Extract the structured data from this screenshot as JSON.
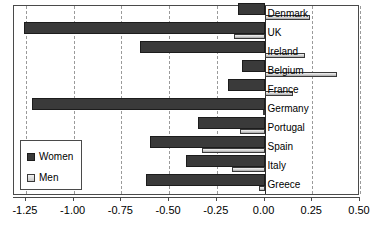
{
  "chart_data": {
    "type": "bar",
    "orientation": "horizontal",
    "title": "",
    "subtitle": "",
    "xlabel": "",
    "ylabel": "",
    "xlim": [
      -1.3125,
      0.5
    ],
    "grid": true,
    "grid_axis": "x",
    "legend_position": "lower-left",
    "categories": [
      "Denmark",
      "UK",
      "Ireland",
      "Belgium",
      "France",
      "Germany",
      "Portugal",
      "Spain",
      "Italy",
      "Greece"
    ],
    "series": [
      {
        "name": "Women",
        "color": "#3a3a3a",
        "values": [
          -0.14,
          -1.26,
          -0.65,
          -0.12,
          -0.19,
          -1.22,
          -0.35,
          -0.6,
          -0.41,
          -0.62
        ]
      },
      {
        "name": "Men",
        "color": "#d0d0d0",
        "values": [
          0.24,
          -0.16,
          0.21,
          0.38,
          0.15,
          -0.01,
          -0.13,
          -0.33,
          -0.17,
          -0.03
        ]
      }
    ],
    "xticks": [
      -1.25,
      -1.0,
      -0.75,
      -0.5,
      -0.25,
      0.0,
      0.25,
      0.5
    ],
    "xticklabels": [
      "-1.25",
      "-1.00",
      "-0.75",
      "-0.50",
      "-0.25",
      "0.00",
      "0.25",
      "0.50"
    ]
  },
  "legend": {
    "items": [
      {
        "label": "Women",
        "swatch": "legend-swatch-women"
      },
      {
        "label": "Men",
        "swatch": "legend-swatch-men"
      }
    ]
  }
}
